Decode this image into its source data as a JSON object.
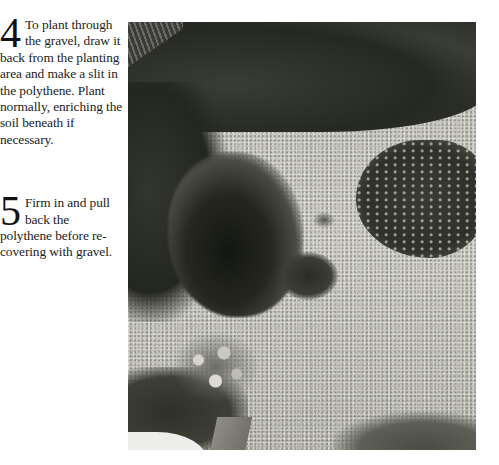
{
  "steps": [
    {
      "number": "4",
      "text": "To plant through the gravel, draw it back from the planting area and make a slit in the polythene. Plant normally, enriching the soil beneath if necessary."
    },
    {
      "number": "5",
      "text": "Firm in and pull back the polythene before re-covering with gravel."
    }
  ],
  "photo": {
    "alt": "Overhead view of a gravel garden with shrubs, a planted island bed and a flowering tub"
  }
}
